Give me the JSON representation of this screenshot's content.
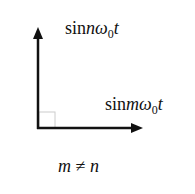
{
  "diagram": {
    "vectors": [
      {
        "name": "vertical",
        "label": {
          "fn": "sin",
          "var": "n",
          "omega": "ω",
          "sub": "0",
          "t": "t"
        }
      },
      {
        "name": "horizontal",
        "label": {
          "fn": "sin",
          "var": "m",
          "omega": "ω",
          "sub": "0",
          "t": "t"
        }
      }
    ],
    "condition": {
      "left": "m",
      "op": "≠",
      "right": "n"
    },
    "colors": {
      "stroke": "#111111",
      "right_angle": "#cccccc",
      "background": "#ffffff"
    }
  }
}
